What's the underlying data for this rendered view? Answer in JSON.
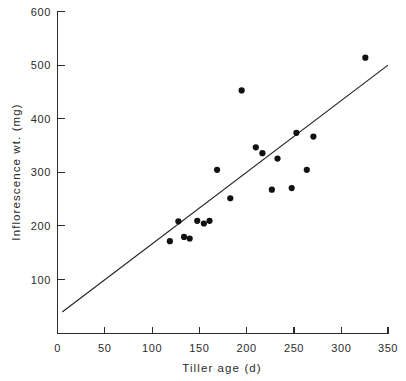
{
  "chart_data": {
    "type": "scatter",
    "title": "",
    "xlabel": "Tiller age  (d)",
    "ylabel": "Inflorescence wt.  (mg)",
    "xlim": [
      0,
      350
    ],
    "ylim": [
      0,
      600
    ],
    "xticks": [
      0,
      50,
      100,
      150,
      200,
      250,
      300,
      350
    ],
    "yticks": [
      100,
      200,
      300,
      400,
      500,
      600
    ],
    "xticklabels": [
      "0",
      "50",
      "100",
      "150",
      "200",
      "250",
      "300",
      "350"
    ],
    "yticklabels": [
      "100",
      "200",
      "300",
      "400",
      "500",
      "600"
    ],
    "grid": false,
    "legend": null,
    "marker": "filled-circle",
    "marker_color": "#111111",
    "points": [
      {
        "x": 119,
        "y": 172
      },
      {
        "x": 128,
        "y": 209
      },
      {
        "x": 134,
        "y": 180
      },
      {
        "x": 140,
        "y": 177
      },
      {
        "x": 148,
        "y": 210
      },
      {
        "x": 155,
        "y": 205
      },
      {
        "x": 161,
        "y": 210
      },
      {
        "x": 169,
        "y": 305
      },
      {
        "x": 183,
        "y": 252
      },
      {
        "x": 195,
        "y": 453
      },
      {
        "x": 210,
        "y": 347
      },
      {
        "x": 217,
        "y": 336
      },
      {
        "x": 227,
        "y": 268
      },
      {
        "x": 233,
        "y": 326
      },
      {
        "x": 248,
        "y": 271
      },
      {
        "x": 253,
        "y": 374
      },
      {
        "x": 264,
        "y": 305
      },
      {
        "x": 271,
        "y": 367
      },
      {
        "x": 326,
        "y": 514
      }
    ],
    "fit_line": {
      "label": "regression line",
      "x_start": 5,
      "y_start": 40,
      "x_end": 350,
      "y_end": 500,
      "color": "#222222"
    }
  },
  "figure": {
    "caption_partial": ""
  }
}
